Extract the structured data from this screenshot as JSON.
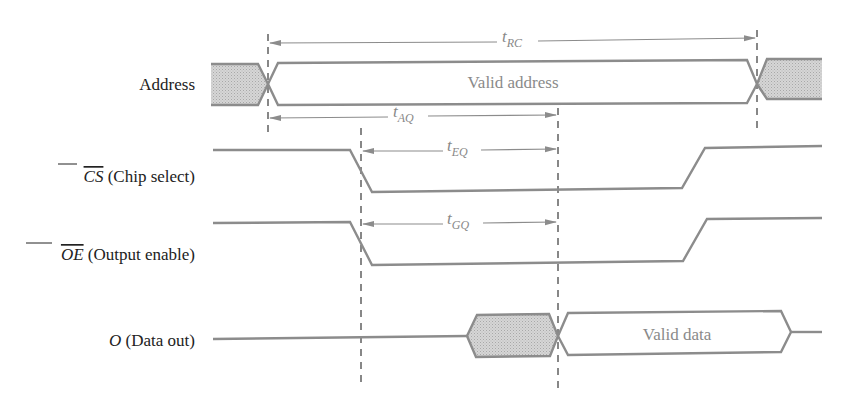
{
  "diagram": {
    "colors": {
      "waveform": "#8c8c8c",
      "invalid_fill": "#cfcfcf",
      "dashed_guides": "#555555",
      "label_text": "#222222",
      "timing_text": "#888888"
    },
    "signals": [
      {
        "id": "address",
        "label": "Address",
        "overbar": "",
        "rest": "Address",
        "inner_text": "Valid address"
      },
      {
        "id": "cs",
        "label": "CS (Chip select)",
        "overbar": "CS",
        "rest": " (Chip select)",
        "active_low": true
      },
      {
        "id": "oe",
        "label": "OE (Output enable)",
        "overbar": "OE",
        "rest": " (Output enable)",
        "active_low": true
      },
      {
        "id": "data",
        "label": "O (Data out)",
        "italic": "O",
        "rest": " (Data out)",
        "inner_text": "Valid data"
      }
    ],
    "timing_params": [
      {
        "id": "t_rc",
        "base": "t",
        "sub": "RC",
        "description": "Read cycle time"
      },
      {
        "id": "t_aq",
        "base": "t",
        "sub": "AQ",
        "description": "Address access time"
      },
      {
        "id": "t_eq",
        "base": "t",
        "sub": "EQ",
        "description": "Chip select to output"
      },
      {
        "id": "t_gq",
        "base": "t",
        "sub": "GQ",
        "description": "Output enable to output"
      }
    ]
  }
}
